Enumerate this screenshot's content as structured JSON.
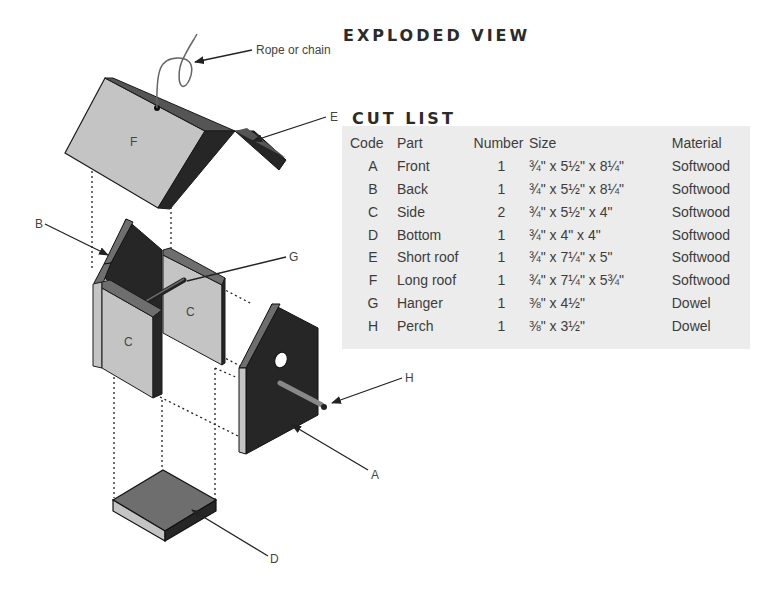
{
  "titles": {
    "exploded_view": "EXPLODED VIEW",
    "cut_list": "CUT LIST"
  },
  "callouts": {
    "rope": "Rope or chain",
    "A": "A",
    "B": "B",
    "D": "D",
    "E": "E",
    "G": "G",
    "H": "H"
  },
  "part_labels": {
    "F": "F",
    "C_back": "C",
    "C_front": "C"
  },
  "cut_list": {
    "headers": [
      "Code",
      "Part",
      "Number",
      "Size",
      "Material"
    ],
    "rows": [
      {
        "code": "A",
        "part": "Front",
        "number": "1",
        "size": "¾\" x 5½\" x 8¼\"",
        "material": "Softwood"
      },
      {
        "code": "B",
        "part": "Back",
        "number": "1",
        "size": "¾\" x 5½\" x 8¼\"",
        "material": "Softwood"
      },
      {
        "code": "C",
        "part": "Side",
        "number": "2",
        "size": "¾\" x 5½\" x 4\"",
        "material": "Softwood"
      },
      {
        "code": "D",
        "part": "Bottom",
        "number": "1",
        "size": "¾\" x 4\" x 4\"",
        "material": "Softwood"
      },
      {
        "code": "E",
        "part": "Short roof",
        "number": "1",
        "size": "¾\" x 7¼\" x 5\"",
        "material": "Softwood"
      },
      {
        "code": "F",
        "part": "Long roof",
        "number": "1",
        "size": "¾\" x 7¼\" x 5¾\"",
        "material": "Softwood"
      },
      {
        "code": "G",
        "part": "Hanger",
        "number": "1",
        "size": "⅜\" x 4½\"",
        "material": "Dowel"
      },
      {
        "code": "H",
        "part": "Perch",
        "number": "1",
        "size": "⅜\" x 3½\"",
        "material": "Dowel"
      }
    ]
  },
  "colors": {
    "light_face": "#c4c4c4",
    "mid_face": "#6e6e6e",
    "dark_face": "#262626",
    "table_bg": "#ececec"
  }
}
